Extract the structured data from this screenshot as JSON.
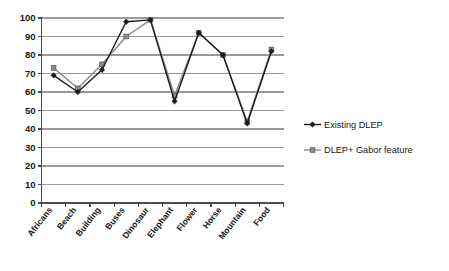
{
  "chart_data": {
    "type": "line",
    "title": "",
    "xlabel": "",
    "ylabel": "",
    "ylim": [
      0,
      100
    ],
    "ytick_step": 10,
    "yticks": [
      "0",
      "10",
      "20",
      "30",
      "40",
      "50",
      "60",
      "70",
      "80",
      "90",
      "100"
    ],
    "grid": true,
    "grid_axis": "y",
    "legend_position": "right",
    "categories": [
      "Africans",
      "Beach",
      "Building",
      "Buses",
      "Dinosaur",
      "Elephant",
      "Flower",
      "Horse",
      "Mountain",
      "Food"
    ],
    "series": [
      {
        "name": "Existing DLEP",
        "marker": "diamond",
        "color": "#1a1a1a",
        "values": [
          69,
          60,
          72,
          98,
          99,
          55,
          92,
          80,
          43,
          82
        ]
      },
      {
        "name": "DLEP+ Gabor feature",
        "marker": "square",
        "color": "#8d8d8d",
        "values": [
          73,
          62,
          75,
          90,
          99,
          58,
          92,
          80,
          44,
          83
        ]
      }
    ]
  },
  "legend": {
    "items": [
      {
        "label": "Existing DLEP"
      },
      {
        "label": "DLEP+ Gabor feature"
      }
    ]
  },
  "colors": {
    "series1": "#1a1a1a",
    "series2": "#8d8d8d",
    "grid": "#9a9a9a",
    "axis": "#4d4d4d",
    "background": "#ffffff"
  }
}
